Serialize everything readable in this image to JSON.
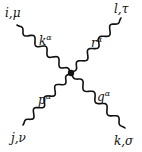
{
  "diagram": {
    "type": "four-point-vertex",
    "vertex": {
      "x": 71,
      "y": 73
    },
    "line_color": "#111111",
    "legs": [
      {
        "id": "top-left",
        "end": {
          "x": 17,
          "y": 25
        },
        "endpoint_label": "i,μ",
        "momentum": "k",
        "momentum_sup": "α"
      },
      {
        "id": "top-right",
        "end": {
          "x": 121,
          "y": 18
        },
        "endpoint_label": "l,τ",
        "momentum": "r",
        "momentum_sup": "α"
      },
      {
        "id": "bottom-left",
        "end": {
          "x": 23,
          "y": 125
        },
        "endpoint_label": "j,ν",
        "momentum": "p",
        "momentum_sup": "α"
      },
      {
        "id": "bottom-right",
        "end": {
          "x": 125,
          "y": 128
        },
        "endpoint_label": "k,σ",
        "momentum": "q",
        "momentum_sup": "α"
      }
    ]
  }
}
